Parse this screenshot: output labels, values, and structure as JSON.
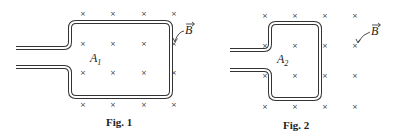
{
  "figures": [
    {
      "id": "fig1",
      "caption": "Fig. 1",
      "area_label": "A",
      "area_subscript": "1",
      "field_label": "B",
      "field_symbol": "cross",
      "cross_glyph": "×",
      "loop": {
        "left": 70,
        "right": 171,
        "top": 22,
        "bottom": 97,
        "lead_start_x": 16,
        "lead_top_y": 48,
        "lead_bottom_y": 67
      },
      "crosses_x": [
        83,
        113,
        144,
        174
      ],
      "crosses_y": [
        13,
        43,
        72,
        104
      ]
    },
    {
      "id": "fig2",
      "caption": "Fig. 2",
      "area_label": "A",
      "area_subscript": "2",
      "field_label": "B",
      "field_symbol": "cross",
      "cross_glyph": "×",
      "loop": {
        "left": 270,
        "right": 320,
        "top": 23,
        "bottom": 99,
        "lead_start_x": 230,
        "lead_top_y": 50,
        "lead_bottom_y": 70
      },
      "crosses_x": [
        265,
        295,
        325,
        355
      ],
      "crosses_y": [
        15,
        45,
        75,
        106
      ]
    }
  ],
  "colors": {
    "wire": "#333333",
    "text": "#222222",
    "background": "#ffffff"
  }
}
